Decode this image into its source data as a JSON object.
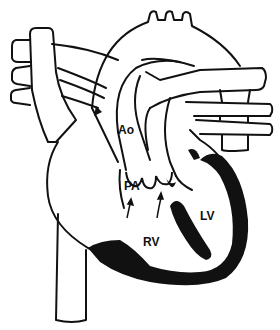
{
  "diagram": {
    "type": "anatomical-line-drawing",
    "colors": {
      "line": "#111111",
      "fill_muscle": "#111111",
      "background": "#ffffff"
    },
    "labels": [
      {
        "id": "ao",
        "text": "Ao",
        "x": 118,
        "y": 124
      },
      {
        "id": "pa",
        "text": "PA",
        "x": 124,
        "y": 180
      },
      {
        "id": "lv",
        "text": "LV",
        "x": 200,
        "y": 210
      },
      {
        "id": "rv",
        "text": "RV",
        "x": 143,
        "y": 236
      }
    ],
    "arrows": [
      {
        "id": "arrow-left",
        "from": [
          127,
          218
        ],
        "to": [
          130,
          203
        ]
      },
      {
        "id": "arrow-right",
        "from": [
          158,
          218
        ],
        "to": [
          161,
          196
        ]
      }
    ]
  }
}
